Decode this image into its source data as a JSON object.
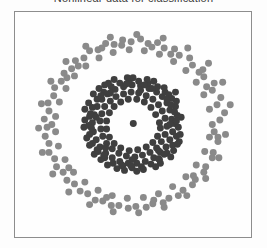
{
  "figure": {
    "title": "Nonlinear data for classification",
    "background_color": "#fdfdfd",
    "frame_color": "#8d8d8d",
    "plot_background": "#fefefe"
  },
  "chart_data": {
    "type": "scatter",
    "title": "Nonlinear data for classification",
    "xlabel": "",
    "ylabel": "",
    "xlim": [
      -1.25,
      1.25
    ],
    "ylim": [
      -1.25,
      1.25
    ],
    "grid": false,
    "axis_ticks_visible": false,
    "legend": null,
    "legend_position": "none",
    "marker": "circle",
    "marker_size_px": 7,
    "series": [
      {
        "name": "inner class",
        "color": "#3f3f3f",
        "description": "dense dark inner ring with hollow centre and one point at the origin",
        "count": 160,
        "ring_radius": 0.42,
        "ring_jitter": 0.12,
        "points": [
          [
            0.003,
            0.012
          ],
          [
            0.41,
            0.06
          ],
          [
            0.39,
            0.16
          ],
          [
            0.36,
            0.24
          ],
          [
            0.31,
            0.31
          ],
          [
            0.25,
            0.36
          ],
          [
            0.17,
            0.4
          ],
          [
            0.08,
            0.43
          ],
          [
            -0.01,
            0.44
          ],
          [
            -0.1,
            0.42
          ],
          [
            -0.19,
            0.39
          ],
          [
            -0.27,
            0.34
          ],
          [
            -0.33,
            0.28
          ],
          [
            -0.38,
            0.2
          ],
          [
            -0.41,
            0.11
          ],
          [
            -0.43,
            0.02
          ],
          [
            -0.42,
            -0.08
          ],
          [
            -0.39,
            -0.17
          ],
          [
            -0.35,
            -0.25
          ],
          [
            -0.29,
            -0.32
          ],
          [
            -0.22,
            -0.37
          ],
          [
            -0.14,
            -0.41
          ],
          [
            -0.05,
            -0.43
          ],
          [
            0.04,
            -0.43
          ],
          [
            0.13,
            -0.41
          ],
          [
            0.22,
            -0.37
          ],
          [
            0.29,
            -0.31
          ],
          [
            0.35,
            -0.25
          ],
          [
            0.39,
            -0.17
          ],
          [
            0.42,
            -0.08
          ],
          [
            0.44,
            0.01
          ],
          [
            0.47,
            0.1
          ],
          [
            0.45,
            0.2
          ],
          [
            0.41,
            0.29
          ],
          [
            0.34,
            0.36
          ],
          [
            0.26,
            0.42
          ],
          [
            0.16,
            0.46
          ],
          [
            0.06,
            0.48
          ],
          [
            -0.04,
            0.48
          ],
          [
            -0.14,
            0.46
          ],
          [
            -0.23,
            0.42
          ],
          [
            -0.31,
            0.36
          ],
          [
            -0.38,
            0.28
          ],
          [
            -0.43,
            0.19
          ],
          [
            -0.46,
            0.09
          ],
          [
            -0.47,
            -0.01
          ],
          [
            -0.46,
            -0.11
          ],
          [
            -0.43,
            -0.21
          ],
          [
            -0.37,
            -0.3
          ],
          [
            -0.3,
            -0.37
          ],
          [
            -0.21,
            -0.43
          ],
          [
            -0.11,
            -0.46
          ],
          [
            -0.01,
            -0.48
          ],
          [
            0.09,
            -0.47
          ],
          [
            0.19,
            -0.44
          ],
          [
            0.28,
            -0.39
          ],
          [
            0.36,
            -0.32
          ],
          [
            0.42,
            -0.23
          ],
          [
            0.46,
            -0.13
          ],
          [
            0.48,
            -0.03
          ],
          [
            0.34,
            0.07
          ],
          [
            0.31,
            0.15
          ],
          [
            0.27,
            0.22
          ],
          [
            0.21,
            0.28
          ],
          [
            0.14,
            0.32
          ],
          [
            0.06,
            0.35
          ],
          [
            -0.02,
            0.36
          ],
          [
            -0.1,
            0.34
          ],
          [
            -0.18,
            0.31
          ],
          [
            -0.24,
            0.26
          ],
          [
            -0.3,
            0.2
          ],
          [
            -0.33,
            0.12
          ],
          [
            -0.35,
            0.04
          ],
          [
            -0.34,
            -0.05
          ],
          [
            -0.32,
            -0.13
          ],
          [
            -0.28,
            -0.21
          ],
          [
            -0.22,
            -0.27
          ],
          [
            -0.15,
            -0.32
          ],
          [
            -0.07,
            -0.35
          ],
          [
            0.02,
            -0.36
          ],
          [
            0.1,
            -0.34
          ],
          [
            0.18,
            -0.31
          ],
          [
            0.25,
            -0.26
          ],
          [
            0.3,
            -0.19
          ],
          [
            0.34,
            -0.11
          ],
          [
            0.36,
            -0.02
          ],
          [
            0.44,
            0.14
          ],
          [
            0.38,
            0.33
          ],
          [
            0.22,
            0.48
          ],
          [
            0.0,
            0.52
          ],
          [
            -0.2,
            0.5
          ],
          [
            -0.36,
            0.4
          ],
          [
            -0.47,
            0.24
          ],
          [
            -0.51,
            0.05
          ],
          [
            -0.49,
            -0.15
          ],
          [
            -0.41,
            -0.33
          ],
          [
            -0.27,
            -0.45
          ],
          [
            -0.09,
            -0.51
          ],
          [
            0.11,
            -0.5
          ],
          [
            0.29,
            -0.43
          ],
          [
            0.43,
            -0.29
          ],
          [
            0.5,
            -0.11
          ],
          [
            0.51,
            0.08
          ],
          [
            0.46,
            0.26
          ],
          [
            0.33,
            0.41
          ],
          [
            0.15,
            0.5
          ],
          [
            -0.06,
            0.52
          ],
          [
            -0.26,
            0.46
          ],
          [
            -0.42,
            0.34
          ],
          [
            -0.51,
            0.17
          ],
          [
            -0.52,
            -0.03
          ],
          [
            -0.46,
            -0.23
          ],
          [
            -0.34,
            -0.39
          ],
          [
            -0.17,
            -0.49
          ],
          [
            0.04,
            -0.52
          ],
          [
            0.24,
            -0.47
          ],
          [
            0.4,
            -0.36
          ],
          [
            0.49,
            -0.19
          ],
          [
            0.28,
            0.02
          ],
          [
            0.24,
            0.11
          ],
          [
            0.19,
            0.19
          ],
          [
            0.12,
            0.25
          ],
          [
            0.04,
            0.28
          ],
          [
            -0.05,
            0.28
          ],
          [
            -0.13,
            0.25
          ],
          [
            -0.2,
            0.2
          ],
          [
            -0.25,
            0.13
          ],
          [
            -0.28,
            0.04
          ],
          [
            -0.28,
            -0.05
          ],
          [
            -0.25,
            -0.14
          ],
          [
            -0.2,
            -0.21
          ],
          [
            -0.13,
            -0.26
          ],
          [
            -0.04,
            -0.29
          ],
          [
            0.05,
            -0.28
          ],
          [
            0.14,
            -0.25
          ],
          [
            0.21,
            -0.2
          ],
          [
            0.26,
            -0.13
          ],
          [
            0.29,
            -0.04
          ],
          [
            0.45,
            0.36
          ],
          [
            0.12,
            0.44
          ],
          [
            -0.3,
            0.44
          ],
          [
            -0.45,
            0.12
          ],
          [
            -0.38,
            -0.28
          ],
          [
            -0.12,
            -0.45
          ],
          [
            0.27,
            -0.38
          ],
          [
            0.47,
            -0.22
          ],
          [
            0.4,
            0.22
          ],
          [
            0.2,
            0.4
          ],
          [
            -0.07,
            0.45
          ],
          [
            -0.34,
            0.32
          ],
          [
            -0.44,
            -0.04
          ],
          [
            -0.31,
            -0.34
          ],
          [
            -0.02,
            -0.46
          ],
          [
            0.33,
            -0.33
          ],
          [
            0.46,
            0.04
          ],
          [
            0.36,
            0.28
          ],
          [
            0.08,
            0.38
          ],
          [
            -0.24,
            0.35
          ],
          [
            -0.39,
            0.08
          ],
          [
            -0.29,
            -0.26
          ],
          [
            -0.01,
            -0.39
          ],
          [
            0.27,
            -0.29
          ],
          [
            0.39,
            0.0
          ]
        ]
      },
      {
        "name": "outer class",
        "color": "#8a8a8a",
        "description": "sparser light-grey outer ring",
        "count": 130,
        "ring_radius": 0.92,
        "ring_jitter": 0.13,
        "points": [
          [
            0.92,
            0.05
          ],
          [
            0.89,
            0.22
          ],
          [
            0.84,
            0.38
          ],
          [
            0.75,
            0.53
          ],
          [
            0.63,
            0.66
          ],
          [
            0.49,
            0.77
          ],
          [
            0.33,
            0.85
          ],
          [
            0.16,
            0.9
          ],
          [
            -0.02,
            0.92
          ],
          [
            -0.2,
            0.89
          ],
          [
            -0.37,
            0.83
          ],
          [
            -0.52,
            0.74
          ],
          [
            -0.65,
            0.62
          ],
          [
            -0.76,
            0.48
          ],
          [
            -0.84,
            0.32
          ],
          [
            -0.89,
            0.15
          ],
          [
            -0.91,
            -0.03
          ],
          [
            -0.89,
            -0.21
          ],
          [
            -0.83,
            -0.38
          ],
          [
            -0.74,
            -0.53
          ],
          [
            -0.62,
            -0.66
          ],
          [
            -0.48,
            -0.77
          ],
          [
            -0.32,
            -0.85
          ],
          [
            -0.15,
            -0.9
          ],
          [
            0.03,
            -0.91
          ],
          [
            0.21,
            -0.88
          ],
          [
            0.38,
            -0.82
          ],
          [
            0.53,
            -0.73
          ],
          [
            0.66,
            -0.61
          ],
          [
            0.77,
            -0.47
          ],
          [
            0.85,
            -0.31
          ],
          [
            0.9,
            -0.14
          ],
          [
            0.97,
            0.13
          ],
          [
            0.93,
            0.3
          ],
          [
            0.86,
            0.46
          ],
          [
            0.74,
            0.61
          ],
          [
            0.6,
            0.74
          ],
          [
            0.44,
            0.84
          ],
          [
            0.26,
            0.91
          ],
          [
            0.08,
            0.95
          ],
          [
            -0.11,
            0.94
          ],
          [
            -0.29,
            0.9
          ],
          [
            -0.46,
            0.82
          ],
          [
            -0.61,
            0.71
          ],
          [
            -0.73,
            0.57
          ],
          [
            -0.83,
            0.41
          ],
          [
            -0.9,
            0.24
          ],
          [
            -0.94,
            0.06
          ],
          [
            -0.93,
            -0.13
          ],
          [
            -0.89,
            -0.31
          ],
          [
            -0.81,
            -0.47
          ],
          [
            -0.7,
            -0.62
          ],
          [
            -0.56,
            -0.74
          ],
          [
            -0.4,
            -0.84
          ],
          [
            -0.23,
            -0.9
          ],
          [
            -0.05,
            -0.93
          ],
          [
            0.14,
            -0.92
          ],
          [
            0.32,
            -0.87
          ],
          [
            0.48,
            -0.79
          ],
          [
            0.63,
            -0.67
          ],
          [
            0.75,
            -0.53
          ],
          [
            0.84,
            -0.37
          ],
          [
            0.9,
            -0.19
          ],
          [
            0.84,
            0.0
          ],
          [
            0.81,
            0.17
          ],
          [
            0.75,
            0.33
          ],
          [
            0.67,
            0.47
          ],
          [
            0.56,
            0.6
          ],
          [
            0.43,
            0.7
          ],
          [
            0.28,
            0.78
          ],
          [
            0.12,
            0.82
          ],
          [
            -0.04,
            0.83
          ],
          [
            -0.21,
            0.8
          ],
          [
            -0.36,
            0.74
          ],
          [
            -0.5,
            0.65
          ],
          [
            -0.62,
            0.54
          ],
          [
            -0.71,
            0.4
          ],
          [
            -0.78,
            0.25
          ],
          [
            -0.82,
            0.09
          ],
          [
            -0.82,
            -0.08
          ],
          [
            -0.79,
            -0.24
          ],
          [
            -0.72,
            -0.39
          ],
          [
            -0.63,
            -0.53
          ],
          [
            -0.51,
            -0.64
          ],
          [
            -0.37,
            -0.73
          ],
          [
            -0.22,
            -0.79
          ],
          [
            -0.06,
            -0.82
          ],
          [
            0.11,
            -0.81
          ],
          [
            0.27,
            -0.77
          ],
          [
            0.42,
            -0.69
          ],
          [
            0.56,
            -0.58
          ],
          [
            0.67,
            -0.45
          ],
          [
            0.76,
            -0.3
          ],
          [
            0.81,
            -0.14
          ],
          [
            1.03,
            0.22
          ],
          [
            0.95,
            0.47
          ],
          [
            0.8,
            0.68
          ],
          [
            0.58,
            0.85
          ],
          [
            0.32,
            0.96
          ],
          [
            0.04,
            1.0
          ],
          [
            -0.24,
            0.97
          ],
          [
            -0.5,
            0.87
          ],
          [
            -0.71,
            0.7
          ],
          [
            -0.87,
            0.48
          ],
          [
            -0.97,
            0.23
          ],
          [
            -1.0,
            -0.04
          ],
          [
            -0.96,
            -0.31
          ],
          [
            -0.85,
            -0.55
          ],
          [
            -0.68,
            -0.75
          ],
          [
            -0.46,
            -0.89
          ],
          [
            -0.21,
            -0.97
          ],
          [
            0.06,
            -0.98
          ],
          [
            0.33,
            -0.92
          ],
          [
            0.57,
            -0.79
          ],
          [
            0.77,
            -0.6
          ],
          [
            0.91,
            -0.37
          ],
          [
            0.98,
            -0.11
          ],
          [
            0.7,
            0.58
          ],
          [
            0.2,
            0.86
          ],
          [
            -0.33,
            0.85
          ],
          [
            -0.7,
            0.52
          ],
          [
            -0.86,
            0.0
          ],
          [
            -0.68,
            -0.48
          ],
          [
            -0.28,
            -0.81
          ],
          [
            0.22,
            -0.84
          ],
          [
            0.64,
            -0.57
          ],
          [
            0.86,
            -0.08
          ],
          [
            0.78,
            0.42
          ],
          [
            0.4,
            0.78
          ],
          [
            -0.12,
            0.88
          ],
          [
            -0.58,
            0.65
          ]
        ]
      }
    ]
  }
}
